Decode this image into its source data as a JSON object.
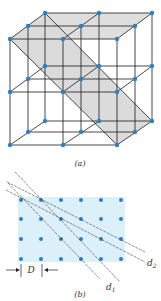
{
  "figure": {
    "part_a": {
      "caption": "(a)",
      "description": "Simple cubic lattice 3x3x3 with shaded diagonal crystal plane",
      "colors": {
        "node": "#2f7fc1",
        "edge": "#1a1a1a",
        "plane": "#d9d9d9"
      }
    },
    "part_b": {
      "caption": "(b)",
      "spacing_label": "D",
      "line_labels": {
        "d1": "d",
        "d1_sub": "1",
        "d2": "d",
        "d2_sub": "2"
      },
      "grid": {
        "columns": 6,
        "rows": 4
      },
      "colors": {
        "node": "#2f7fc1",
        "background": "#dcf0fa",
        "line": "#444444"
      }
    }
  }
}
